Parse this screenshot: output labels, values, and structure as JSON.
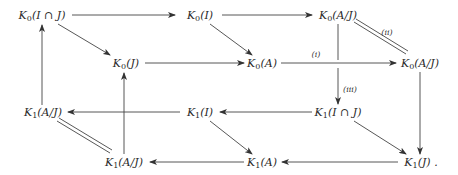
{
  "diagram": {
    "type": "commutative-diagram",
    "nodes": [
      {
        "id": "k0_ij",
        "K": "K",
        "sub": "0",
        "arg": "(I ∩ J)",
        "x": 42,
        "y": 16
      },
      {
        "id": "k0_i",
        "K": "K",
        "sub": "0",
        "arg": "(I)",
        "x": 200,
        "y": 16
      },
      {
        "id": "k0_aj_top",
        "K": "K",
        "sub": "0",
        "arg": "(A/J)",
        "x": 338,
        "y": 16
      },
      {
        "id": "k0_j",
        "K": "K",
        "sub": "0",
        "arg": "(J)",
        "x": 126,
        "y": 64
      },
      {
        "id": "k0_a",
        "K": "K",
        "sub": "0",
        "arg": "(A)",
        "x": 262,
        "y": 64
      },
      {
        "id": "k0_aj_right",
        "K": "K",
        "sub": "0",
        "arg": "(A/J)",
        "x": 420,
        "y": 64
      },
      {
        "id": "k1_aj_left",
        "K": "K",
        "sub": "1",
        "arg": "(A/J)",
        "x": 43,
        "y": 113
      },
      {
        "id": "k1_i",
        "K": "K",
        "sub": "1",
        "arg": "(I)",
        "x": 200,
        "y": 113
      },
      {
        "id": "k1_ij",
        "K": "K",
        "sub": "1",
        "arg": "(I ∩ J)",
        "x": 338,
        "y": 113
      },
      {
        "id": "k1_aj_bottom",
        "K": "K",
        "sub": "1",
        "arg": "(A/J)",
        "x": 124,
        "y": 163
      },
      {
        "id": "k1_a",
        "K": "K",
        "sub": "1",
        "arg": "(A)",
        "x": 262,
        "y": 163
      },
      {
        "id": "k1_j",
        "K": "K",
        "sub": "1",
        "arg": "(J) .",
        "x": 421,
        "y": 163
      }
    ],
    "edge_labels": [
      {
        "id": "label_i",
        "text": "(i)",
        "x": 316,
        "y": 54
      },
      {
        "id": "label_ii",
        "text": "(ii)",
        "x": 387,
        "y": 32
      },
      {
        "id": "label_iii",
        "text": "(iii)",
        "x": 350,
        "y": 89
      }
    ]
  }
}
